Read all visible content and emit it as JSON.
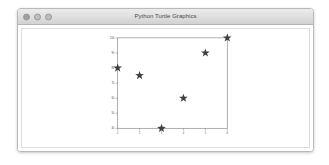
{
  "window": {
    "title": "Python Turtle Graphics",
    "controls": [
      {
        "name": "close",
        "label": "Close"
      },
      {
        "name": "minimize",
        "label": "Minimize"
      },
      {
        "name": "zoom",
        "label": "Zoom"
      }
    ]
  },
  "colors": {
    "marker": "#3f3f3f",
    "axis": "#8c8c8c",
    "tick_label": "#4d4d4d",
    "titlebar_top": "#ececec",
    "titlebar_bottom": "#d2d2d2",
    "window_border": "#b9b9b9",
    "canvas_bg": "#ffffff",
    "desktop_bg": "#ffffff"
  },
  "chart_data": {
    "type": "scatter",
    "title": "",
    "xlabel": "",
    "ylabel": "",
    "marker": "star",
    "marker_color": "#3f3f3f",
    "grid": false,
    "legend": null,
    "x": [
      1,
      2,
      3,
      4,
      5,
      6
    ],
    "y": [
      80,
      75,
      40,
      60,
      90,
      100
    ],
    "points": [
      {
        "x": 1,
        "y": 80
      },
      {
        "x": 2,
        "y": 75
      },
      {
        "x": 3,
        "y": 40
      },
      {
        "x": 4,
        "y": 60
      },
      {
        "x": 5,
        "y": 90
      },
      {
        "x": 6,
        "y": 100
      }
    ],
    "xlim": [
      1,
      6
    ],
    "ylim": [
      40,
      100
    ],
    "xticks": [
      1,
      2,
      3,
      4,
      5,
      6
    ],
    "xticklabels": [
      "1",
      "2",
      "3",
      "4",
      "5",
      "6"
    ],
    "yticks": [
      40,
      50,
      60,
      70,
      80,
      90,
      100
    ],
    "yticklabels": [
      "40",
      "50",
      "60",
      "70",
      "80",
      "90",
      "100"
    ]
  }
}
